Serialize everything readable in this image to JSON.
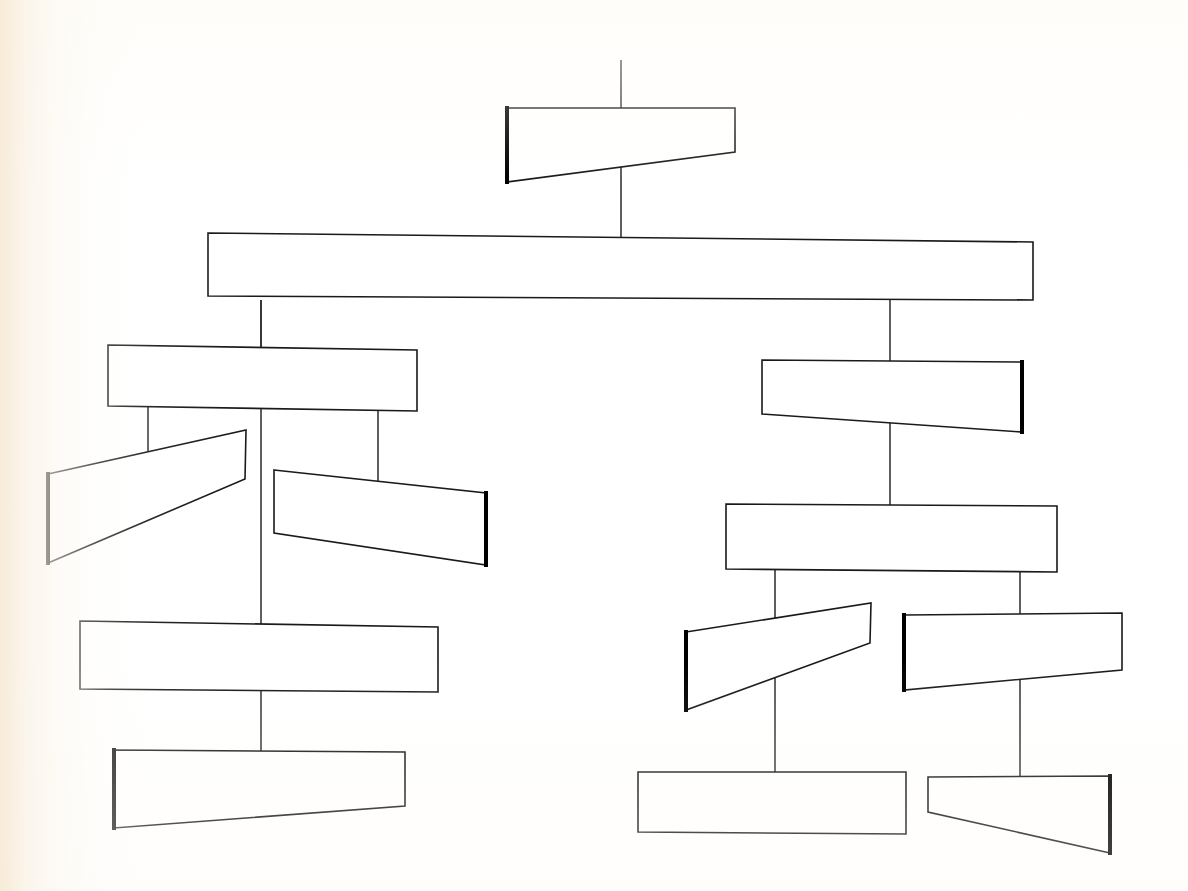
{
  "document": {
    "title": "Blank Hierarchy Diagram",
    "kind": "organization-chart",
    "description": "Hand-drawn style tree diagram of empty labelless boxes connected by straight lines",
    "width": 1188,
    "height": 891
  },
  "style": {
    "page_background": "#ffffff",
    "scan_edge_tint": "#f7ead6",
    "node_fill": "#ffffff",
    "node_stroke": "#1a1a1a",
    "node_stroke_width": 1.6,
    "accent_edge_stroke": "#000000",
    "accent_edge_width": 4,
    "connector_stroke": "#2a2a2a",
    "connector_width": 1.5
  },
  "connectors": [
    {
      "id": "c-root-stem",
      "name": "root-stem",
      "x1": 621,
      "y1": 60,
      "x2": 621,
      "y2": 125
    },
    {
      "id": "c-root-to-bar",
      "name": "root-to-spine-bar",
      "x1": 621,
      "y1": 148,
      "x2": 621,
      "y2": 247
    },
    {
      "id": "c-bar-to-left",
      "name": "spine-bar-to-left-group",
      "x1": 261,
      "y1": 300,
      "x2": 261,
      "y2": 350
    },
    {
      "id": "c-bar-to-right",
      "name": "spine-bar-to-right-group",
      "x1": 890,
      "y1": 298,
      "x2": 890,
      "y2": 372
    },
    {
      "id": "c-left-spine",
      "name": "left-vertical-spine",
      "x1": 261,
      "y1": 300,
      "x2": 261,
      "y2": 752
    },
    {
      "id": "c-left-a",
      "name": "left-node-a-drop",
      "x1": 148,
      "y1": 404,
      "x2": 148,
      "y2": 484
    },
    {
      "id": "c-left-b",
      "name": "left-node-b-drop",
      "x1": 378,
      "y1": 407,
      "x2": 378,
      "y2": 500
    },
    {
      "id": "c-right-spine",
      "name": "right-vertical-spine",
      "x1": 890,
      "y1": 400,
      "x2": 890,
      "y2": 512
    },
    {
      "id": "c-right-a",
      "name": "right-node-a-drop",
      "x1": 775,
      "y1": 568,
      "x2": 775,
      "y2": 790
    },
    {
      "id": "c-right-b",
      "name": "right-node-b-drop",
      "x1": 1020,
      "y1": 570,
      "x2": 1020,
      "y2": 790
    }
  ],
  "nodes": [
    {
      "id": "n-root",
      "name": "root-node",
      "level": 0,
      "label": "",
      "accent_edge": "left",
      "points": "507,108 735,108 735,152 507,182"
    },
    {
      "id": "n-spine-bar",
      "name": "spine-bar-node",
      "level": 1,
      "label": "",
      "accent_edge": "none",
      "points": "208,233 1033,242 1033,300 208,296"
    },
    {
      "id": "n-left-head",
      "name": "left-branch-head-node",
      "level": 2,
      "label": "",
      "accent_edge": "none",
      "points": "108,345 417,350 417,411 108,406"
    },
    {
      "id": "n-left-a",
      "name": "left-child-a-node",
      "level": 3,
      "label": "",
      "accent_edge": "left",
      "points": "48,474 246,430 245,479 48,563"
    },
    {
      "id": "n-left-b",
      "name": "left-child-b-node",
      "level": 3,
      "label": "",
      "accent_edge": "right",
      "points": "274,470 486,493 486,565 274,533"
    },
    {
      "id": "n-left-mid",
      "name": "left-mid-node",
      "level": 4,
      "label": "",
      "accent_edge": "none",
      "points": "80,621 438,627 438,692 80,689"
    },
    {
      "id": "n-left-tail",
      "name": "left-tail-node",
      "level": 5,
      "label": "",
      "accent_edge": "left",
      "points": "114,750 405,752 405,806 114,828"
    },
    {
      "id": "n-right-head",
      "name": "right-branch-head-node",
      "level": 2,
      "label": "",
      "accent_edge": "right",
      "points": "762,360 1022,362 1022,432 762,414"
    },
    {
      "id": "n-right-mid",
      "name": "right-mid-node",
      "level": 3,
      "label": "",
      "accent_edge": "none",
      "points": "726,504 1057,506 1057,572 726,569"
    },
    {
      "id": "n-right-a",
      "name": "right-child-a-node",
      "level": 4,
      "label": "",
      "accent_edge": "left",
      "points": "686,632 871,603 870,643 686,710"
    },
    {
      "id": "n-right-b",
      "name": "right-child-b-node",
      "level": 4,
      "label": "",
      "accent_edge": "left",
      "points": "904,615 1122,613 1122,670 904,690"
    },
    {
      "id": "n-right-tail-a",
      "name": "right-tail-a-node",
      "level": 5,
      "label": "",
      "accent_edge": "none",
      "points": "638,772 906,772 906,834 638,832"
    },
    {
      "id": "n-right-tail-b",
      "name": "right-tail-b-node",
      "level": 5,
      "label": "",
      "accent_edge": "right",
      "points": "928,777 1110,776 1110,853 928,812"
    }
  ]
}
